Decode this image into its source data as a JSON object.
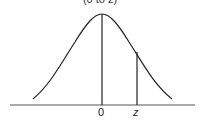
{
  "title": "(0 to z)",
  "labels": {
    "zero": "0",
    "z": "z"
  },
  "colors": {
    "line": "#222222",
    "background": "#ffffff"
  },
  "diagram": {
    "type": "normal-distribution-curve",
    "shaded_region": "area between 0 and z",
    "markers": [
      "0",
      "z"
    ]
  }
}
